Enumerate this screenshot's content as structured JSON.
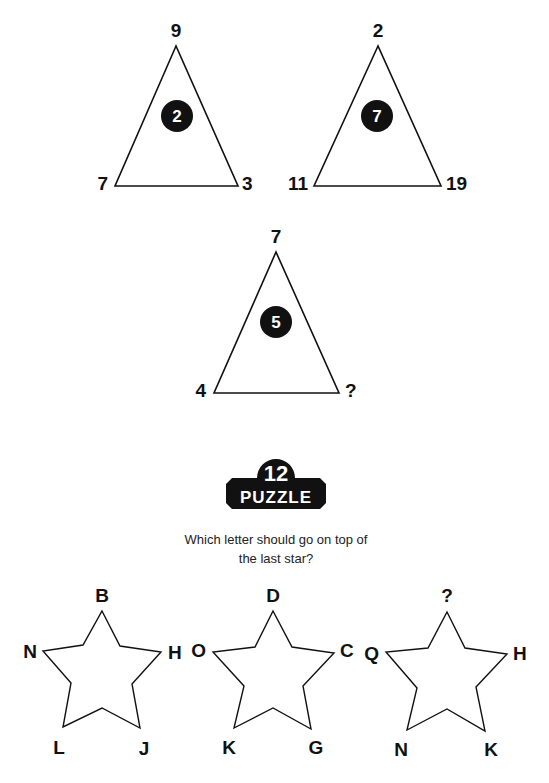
{
  "triangle_puzzle": {
    "triangles": [
      {
        "top": "9",
        "left": "7",
        "right": "3",
        "center": "2"
      },
      {
        "top": "2",
        "left": "11",
        "right": "19",
        "center": "7"
      },
      {
        "top": "7",
        "left": "4",
        "right": "?",
        "center": "5"
      }
    ]
  },
  "badge": {
    "number": "12",
    "word": "PUZZLE"
  },
  "question": {
    "line1": "Which letter should go on top of",
    "line2": "the last star?"
  },
  "star_puzzle": {
    "stars": [
      {
        "top": "B",
        "left": "N",
        "right": "H",
        "bottom_left": "L",
        "bottom_right": "J"
      },
      {
        "top": "D",
        "left": "O",
        "right": "C",
        "bottom_left": "K",
        "bottom_right": "G"
      },
      {
        "top": "?",
        "left": "Q",
        "right": "H",
        "bottom_left": "N",
        "bottom_right": "K"
      }
    ]
  },
  "colors": {
    "ink": "#111111",
    "background": "#ffffff"
  }
}
